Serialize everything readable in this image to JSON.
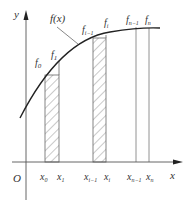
{
  "diagram": {
    "type": "riemann-rectangles",
    "axes": {
      "x_label": "x",
      "y_label": "y",
      "origin_label": "O"
    },
    "curve": {
      "label": "f(x)",
      "color": "#222222"
    },
    "x_ticks": [
      {
        "id": "x0",
        "label": "x",
        "sub": "0"
      },
      {
        "id": "x1",
        "label": "x",
        "sub": "1"
      },
      {
        "id": "xi_1",
        "label": "x",
        "sub": "i−1"
      },
      {
        "id": "xi",
        "label": "x",
        "sub": "i"
      },
      {
        "id": "xn_1",
        "label": "x",
        "sub": "n−1"
      },
      {
        "id": "xn",
        "label": "x",
        "sub": "n"
      }
    ],
    "f_labels": [
      {
        "id": "f0",
        "label": "f",
        "sub": "0"
      },
      {
        "id": "f1",
        "label": "f",
        "sub": "1"
      },
      {
        "id": "fi_1",
        "label": "f",
        "sub": "i−1"
      },
      {
        "id": "fi",
        "label": "f",
        "sub": "i"
      },
      {
        "id": "fn_1",
        "label": "f",
        "sub": "n−1"
      },
      {
        "id": "fn",
        "label": "f",
        "sub": "n"
      }
    ],
    "hatched_strips": [
      {
        "from": "x0",
        "to": "x1"
      },
      {
        "from": "xi_1",
        "to": "xi"
      }
    ],
    "colors": {
      "axis": "#555555",
      "strip": "#666666",
      "hatch": "#777777",
      "text": "#333333"
    }
  }
}
